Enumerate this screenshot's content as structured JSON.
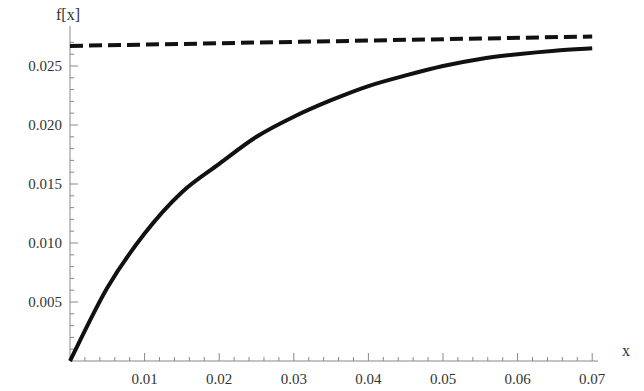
{
  "chart_data": {
    "type": "line",
    "title": "",
    "xlabel": "x",
    "ylabel": "f[x]",
    "xlim": [
      0,
      0.07
    ],
    "ylim": [
      0,
      0.0275
    ],
    "grid": false,
    "legend": null,
    "x_ticks": [
      "0.01",
      "0.02",
      "0.03",
      "0.04",
      "0.05",
      "0.06",
      "0.07"
    ],
    "y_ticks": [
      "0.005",
      "0.010",
      "0.015",
      "0.020",
      "0.025"
    ],
    "series": [
      {
        "name": "f[x]",
        "style": "solid",
        "color": "#111111",
        "x": [
          0,
          0.005,
          0.01,
          0.015,
          0.02,
          0.025,
          0.03,
          0.035,
          0.04,
          0.045,
          0.05,
          0.055,
          0.06,
          0.065,
          0.07
        ],
        "y": [
          0,
          0.0062,
          0.0108,
          0.0143,
          0.0167,
          0.019,
          0.0207,
          0.0221,
          0.0233,
          0.0242,
          0.025,
          0.0256,
          0.026,
          0.0263,
          0.0265
        ]
      },
      {
        "name": "asymptote",
        "style": "dashed",
        "color": "#111111",
        "x": [
          0,
          0.07
        ],
        "y": [
          0.0267,
          0.0275
        ]
      }
    ]
  }
}
